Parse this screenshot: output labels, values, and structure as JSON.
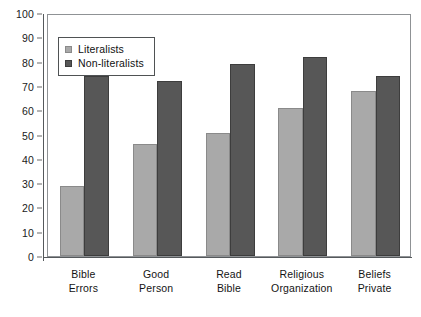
{
  "chart_data": {
    "type": "bar",
    "title": "",
    "subtitle": "",
    "xlabel": "",
    "ylabel": "",
    "ylim": [
      0,
      100
    ],
    "yticks": [
      0,
      10,
      20,
      30,
      40,
      50,
      60,
      70,
      80,
      90,
      100
    ],
    "ytick_labels": [
      "0",
      "10",
      "20",
      "30",
      "40",
      "50",
      "60",
      "70",
      "80",
      "90",
      "100"
    ],
    "grid": false,
    "legend_position": "upper-left-inside",
    "categories": [
      "Bible Errors",
      "Good Person",
      "Read Bible",
      "Religious Organization",
      "Beliefs Private"
    ],
    "category_lines": [
      [
        "Bible",
        "Errors"
      ],
      [
        "Good",
        "Person"
      ],
      [
        "Read",
        "Bible"
      ],
      [
        "Religious",
        "Organization"
      ],
      [
        "Beliefs",
        "Private"
      ]
    ],
    "series": [
      {
        "name": "Literalists",
        "color": "#a9a9a9",
        "values": [
          29,
          46,
          50.5,
          61,
          68
        ]
      },
      {
        "name": "Non-literalists",
        "color": "#575757",
        "values": [
          74,
          72,
          79,
          82,
          74
        ]
      }
    ]
  },
  "legend": {
    "items": [
      {
        "label": "Literalists",
        "swatch": "legend-swatch-literalists"
      },
      {
        "label": "Non-literalists",
        "swatch": "legend-swatch-non-literalists"
      }
    ]
  },
  "colors": {
    "series_light": "#a9a9a9",
    "series_dark": "#575757",
    "axis": "#55595c",
    "plot_border": "#8f9295",
    "background": "#ffffff",
    "text": "#141414"
  }
}
